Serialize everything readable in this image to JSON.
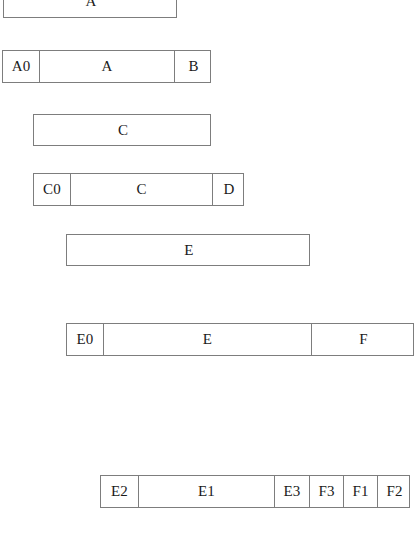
{
  "diagram": {
    "type": "interval-decomposition",
    "title": "",
    "background_color": "#ffffff",
    "line_color": "#7d7d7d",
    "text_color": "#1a1a1a",
    "canvas": {
      "width": 420,
      "height": 548
    },
    "rows": [
      {
        "id": "row-1",
        "name": "row-a-whole",
        "clipped_top": true,
        "x": 3,
        "y": -14,
        "width": 174,
        "height": 32,
        "cells": [
          {
            "label": "A",
            "width": 174
          }
        ]
      },
      {
        "id": "row-2",
        "name": "row-a-split",
        "clipped_top": false,
        "x": 2,
        "y": 50,
        "width": 209,
        "height": 33,
        "cells": [
          {
            "label": "A0",
            "width": 36
          },
          {
            "label": "A",
            "width": 135
          },
          {
            "label": "B",
            "width": 38
          }
        ]
      },
      {
        "id": "row-3",
        "name": "row-c-whole",
        "clipped_top": false,
        "x": 33,
        "y": 114,
        "width": 178,
        "height": 32,
        "cells": [
          {
            "label": "C",
            "width": 178
          }
        ]
      },
      {
        "id": "row-4",
        "name": "row-c-split",
        "clipped_top": false,
        "x": 33,
        "y": 173,
        "width": 211,
        "height": 33,
        "cells": [
          {
            "label": "C0",
            "width": 36
          },
          {
            "label": "C",
            "width": 142
          },
          {
            "label": "D",
            "width": 33
          }
        ]
      },
      {
        "id": "row-5",
        "name": "row-e-whole",
        "clipped_top": false,
        "x": 66,
        "y": 234,
        "width": 244,
        "height": 32,
        "cells": [
          {
            "label": "E",
            "width": 244
          }
        ]
      },
      {
        "id": "row-6",
        "name": "row-e-split",
        "clipped_top": false,
        "x": 66,
        "y": 323,
        "width": 348,
        "height": 33,
        "cells": [
          {
            "label": "E0",
            "width": 36
          },
          {
            "label": "E",
            "width": 208
          },
          {
            "label": "F",
            "width": 104
          }
        ]
      },
      {
        "id": "row-7",
        "name": "row-e-f-subsplit",
        "clipped_top": false,
        "x": 100,
        "y": 475,
        "width": 310,
        "height": 33,
        "cells": [
          {
            "label": "E2",
            "width": 37
          },
          {
            "label": "E1",
            "width": 136
          },
          {
            "label": "E3",
            "width": 35
          },
          {
            "label": "F3",
            "width": 34
          },
          {
            "label": "F1",
            "width": 34
          },
          {
            "label": "F2",
            "width": 34
          }
        ]
      }
    ]
  }
}
